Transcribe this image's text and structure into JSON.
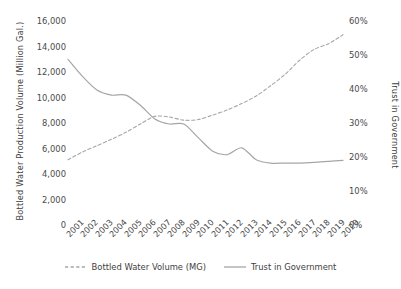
{
  "chart_data": {
    "type": "line",
    "title": "",
    "xlabel": "",
    "ylabel": "Bottled Water Production Volume (Million Gal.)",
    "y2label": "Trust in Government",
    "grid": false,
    "legend_position": "bottom",
    "x": [
      "2001",
      "2002",
      "2003",
      "2004",
      "2005",
      "2006",
      "2007",
      "2008",
      "2009",
      "2010",
      "2011",
      "2012",
      "2013",
      "2014",
      "2015",
      "2016",
      "2017",
      "2018",
      "2019",
      "2020"
    ],
    "ylim": [
      0,
      16000
    ],
    "yticks": [
      "0",
      "2,000",
      "4,000",
      "6,000",
      "8,000",
      "10,000",
      "12,000",
      "14,000",
      "16,000"
    ],
    "ytick_values": [
      0,
      2000,
      4000,
      6000,
      8000,
      10000,
      12000,
      14000,
      16000
    ],
    "y2lim": [
      0,
      60
    ],
    "y2ticks": [
      "0%",
      "10%",
      "20%",
      "30%",
      "40%",
      "50%",
      "60%"
    ],
    "y2tick_values": [
      0,
      10,
      20,
      30,
      40,
      50,
      60
    ],
    "series": [
      {
        "name": "Bottled Water Volume (MG)",
        "axis": "left",
        "style": "dashed",
        "color": "#a6a6a6",
        "values": [
          5200,
          5800,
          6300,
          6800,
          7350,
          8000,
          8600,
          8550,
          8300,
          8350,
          8700,
          9100,
          9600,
          10200,
          11000,
          11900,
          13000,
          13850,
          14300,
          15000
        ]
      },
      {
        "name": "Trust in Government",
        "axis": "right",
        "style": "solid",
        "color": "#a6a6a6",
        "values": [
          49.0,
          44.0,
          40.0,
          38.5,
          38.5,
          35.5,
          31.5,
          30.0,
          30.0,
          26.0,
          22.0,
          21.0,
          23.0,
          19.5,
          18.5,
          18.5,
          18.5,
          18.7,
          19.0,
          19.3
        ]
      }
    ]
  },
  "legend": {
    "items": [
      {
        "label": "Bottled Water Volume (MG)",
        "style": "dashed"
      },
      {
        "label": "Trust in Government",
        "style": "solid"
      }
    ]
  },
  "caption": ""
}
